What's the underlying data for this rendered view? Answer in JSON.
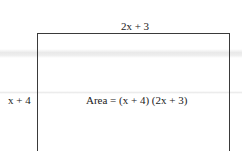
{
  "diagram": {
    "type": "rectangle-area",
    "top_label": "2x + 3",
    "side_label": "x + 4",
    "area_label": "Area = (x + 4) (2x + 3)"
  }
}
